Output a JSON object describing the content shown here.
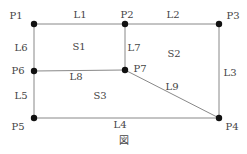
{
  "diagram": {
    "caption": "図",
    "points": [
      {
        "id": "P1",
        "x": 34,
        "y": 24,
        "label_x": 16,
        "label_y": 16
      },
      {
        "id": "P2",
        "x": 125,
        "y": 24,
        "label_x": 127,
        "label_y": 15
      },
      {
        "id": "P3",
        "x": 219,
        "y": 24,
        "label_x": 233,
        "label_y": 16
      },
      {
        "id": "P4",
        "x": 219,
        "y": 118,
        "label_x": 232,
        "label_y": 127
      },
      {
        "id": "P5",
        "x": 34,
        "y": 118,
        "label_x": 18,
        "label_y": 127
      },
      {
        "id": "P6",
        "x": 34,
        "y": 71,
        "label_x": 18,
        "label_y": 71
      },
      {
        "id": "P7",
        "x": 125,
        "y": 70,
        "label_x": 140,
        "label_y": 69
      }
    ],
    "lines": [
      {
        "id": "L1",
        "from": "P1",
        "to": "P2",
        "label_x": 80,
        "label_y": 15
      },
      {
        "id": "L2",
        "from": "P2",
        "to": "P3",
        "label_x": 173,
        "label_y": 15
      },
      {
        "id": "L3",
        "from": "P3",
        "to": "P4",
        "label_x": 230,
        "label_y": 73
      },
      {
        "id": "L4",
        "from": "P5",
        "to": "P4",
        "label_x": 120,
        "label_y": 125
      },
      {
        "id": "L5",
        "from": "P6",
        "to": "P5",
        "label_x": 21,
        "label_y": 96
      },
      {
        "id": "L6",
        "from": "P1",
        "to": "P6",
        "label_x": 21,
        "label_y": 48
      },
      {
        "id": "L7",
        "from": "P2",
        "to": "P7",
        "label_x": 134,
        "label_y": 48
      },
      {
        "id": "L8",
        "from": "P6",
        "to": "P7",
        "label_x": 76,
        "label_y": 77
      },
      {
        "id": "L9",
        "from": "P7",
        "to": "P4",
        "label_x": 172,
        "label_y": 87
      }
    ],
    "regions": [
      {
        "id": "S1",
        "label_x": 79,
        "label_y": 47
      },
      {
        "id": "S2",
        "label_x": 174,
        "label_y": 54
      },
      {
        "id": "S3",
        "label_x": 100,
        "label_y": 96
      }
    ],
    "colors": {
      "line": "#888888",
      "point": "#111111",
      "text": "#444444"
    }
  }
}
